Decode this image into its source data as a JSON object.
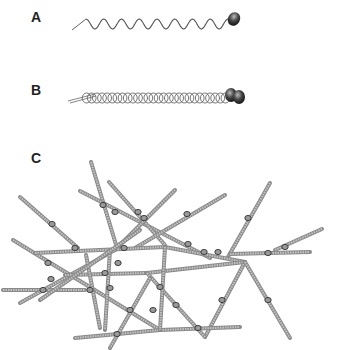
{
  "figure": {
    "panels": [
      {
        "label": "A",
        "description": "single filament with wavy tail and head"
      },
      {
        "label": "B",
        "description": "coiled helical filament bundle with globular heads"
      },
      {
        "label": "C",
        "description": "crosslinked filament network"
      }
    ]
  },
  "panel_a": {
    "label": "A",
    "wave": {
      "x_start": 86,
      "x_end": 228,
      "y_center": 24,
      "amplitude": 5,
      "cycles": 8
    },
    "head": {
      "cx": 234,
      "cy": 19,
      "rx": 6,
      "ry": 7
    }
  },
  "panel_b": {
    "label": "B",
    "coil": {
      "x_start": 84,
      "x_end": 228,
      "y_center": 98,
      "radius": 5,
      "turns": 28
    },
    "heads": [
      {
        "cx": 231,
        "cy": 95
      },
      {
        "cx": 239,
        "cy": 97
      }
    ]
  },
  "panel_c": {
    "label": "C",
    "filaments": [
      [
        20,
        197,
        78,
        248
      ],
      [
        91,
        162,
        117,
        248
      ],
      [
        80,
        191,
        210,
        258
      ],
      [
        109,
        182,
        165,
        245
      ],
      [
        175,
        190,
        115,
        250
      ],
      [
        225,
        195,
        135,
        248
      ],
      [
        270,
        183,
        228,
        257
      ],
      [
        322,
        229,
        275,
        250
      ],
      [
        13,
        240,
        160,
        330
      ],
      [
        35,
        253,
        165,
        247
      ],
      [
        165,
        247,
        245,
        262
      ],
      [
        3,
        290,
        85,
        290
      ],
      [
        20,
        303,
        115,
        250
      ],
      [
        65,
        275,
        147,
        273
      ],
      [
        147,
        273,
        245,
        262
      ],
      [
        230,
        254,
        310,
        252
      ],
      [
        245,
        262,
        205,
        337
      ],
      [
        245,
        262,
        290,
        338
      ],
      [
        147,
        273,
        205,
        337
      ],
      [
        75,
        338,
        160,
        330
      ],
      [
        160,
        330,
        240,
        327
      ],
      [
        165,
        247,
        160,
        330
      ],
      [
        86,
        255,
        100,
        328
      ],
      [
        110,
        250,
        105,
        330
      ],
      [
        150,
        278,
        110,
        348
      ],
      [
        140,
        230,
        40,
        300
      ]
    ],
    "crosslinks": [
      [
        52,
        224
      ],
      [
        103,
        205
      ],
      [
        115,
        212
      ],
      [
        138,
        212
      ],
      [
        144,
        218
      ],
      [
        187,
        214
      ],
      [
        248,
        218
      ],
      [
        285,
        247
      ],
      [
        75,
        248
      ],
      [
        124,
        248
      ],
      [
        188,
        244
      ],
      [
        204,
        252
      ],
      [
        218,
        252
      ],
      [
        268,
        253
      ],
      [
        48,
        263
      ],
      [
        51,
        279
      ],
      [
        43,
        290
      ],
      [
        105,
        273
      ],
      [
        118,
        263
      ],
      [
        90,
        290
      ],
      [
        110,
        288
      ],
      [
        160,
        287
      ],
      [
        176,
        305
      ],
      [
        130,
        310
      ],
      [
        222,
        300
      ],
      [
        268,
        300
      ],
      [
        198,
        328
      ],
      [
        117,
        334
      ],
      [
        153,
        310
      ]
    ]
  }
}
